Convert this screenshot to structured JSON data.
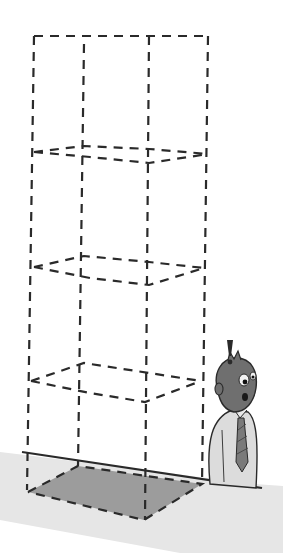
{
  "illustration": {
    "subject": "dashed wireframe tower of stacked boxes above a shaded floor footprint, with a surprised man",
    "exclamation": "!",
    "colors": {
      "line": "#2a2a2a",
      "floor_shadow": "#e4e4e4",
      "footprint": "#9c9c9c",
      "head": "#6f6f6f",
      "shirt": "#dcdcdc",
      "tie": "#7a7a7a"
    },
    "levels": 4
  }
}
